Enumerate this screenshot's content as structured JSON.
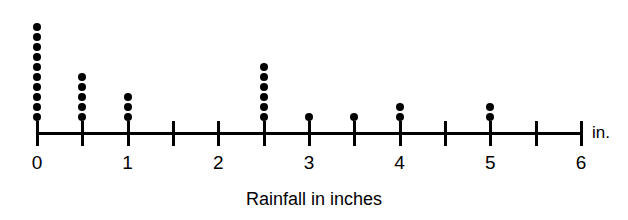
{
  "chart_data": {
    "type": "scatter",
    "plot_style": "dot-plot",
    "title": "",
    "xlabel": "Rainfall in inches",
    "ylabel": "",
    "unit_label": "in.",
    "grid": false,
    "legend": null,
    "xlim": [
      0,
      6
    ],
    "x_tick_step": 0.5,
    "x_labeled_ticks": [
      "0",
      "1",
      "2",
      "3",
      "4",
      "5",
      "6"
    ],
    "tick_positions": [
      0,
      0.5,
      1,
      1.5,
      2,
      2.5,
      3,
      3.5,
      4,
      4.5,
      5,
      5.5,
      6
    ],
    "dot_color": "#000000",
    "background_color": "#ffffff",
    "x": [
      0,
      0.5,
      1,
      1.5,
      2,
      2.5,
      3,
      3.5,
      4,
      4.5,
      5,
      5.5,
      6
    ],
    "counts": [
      10,
      5,
      3,
      0,
      0,
      6,
      1,
      1,
      2,
      0,
      2,
      0,
      0
    ],
    "total_observations": 30
  },
  "axis": {
    "title": "Rainfall in inches",
    "unit": "in.",
    "tick_labels": [
      {
        "value": 0,
        "label": "0"
      },
      {
        "value": 0.5,
        "label": ""
      },
      {
        "value": 1,
        "label": "1"
      },
      {
        "value": 1.5,
        "label": ""
      },
      {
        "value": 2,
        "label": "2"
      },
      {
        "value": 2.5,
        "label": ""
      },
      {
        "value": 3,
        "label": "3"
      },
      {
        "value": 3.5,
        "label": ""
      },
      {
        "value": 4,
        "label": "4"
      },
      {
        "value": 4.5,
        "label": ""
      },
      {
        "value": 5,
        "label": "5"
      },
      {
        "value": 5.5,
        "label": ""
      },
      {
        "value": 6,
        "label": "6"
      }
    ]
  },
  "geometry": {
    "origin_x_px": 37,
    "unit_width_px": 90.667,
    "baseline_y_px": 121,
    "dot_diameter_px": 8,
    "dot_pitch_px": 10
  }
}
